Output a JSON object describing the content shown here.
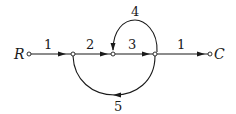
{
  "diagram": {
    "type": "signal-flow-graph",
    "input_label": "R",
    "output_label": "C",
    "colors": {
      "stroke": "#1a1a1a",
      "node_fill": "#ffffff",
      "background": "#ffffff"
    },
    "nodes": [
      {
        "id": "R",
        "x": 29,
        "y": 54
      },
      {
        "id": "n1",
        "x": 73,
        "y": 54
      },
      {
        "id": "n2",
        "x": 113,
        "y": 54
      },
      {
        "id": "n3",
        "x": 155,
        "y": 54
      },
      {
        "id": "C",
        "x": 210,
        "y": 54
      }
    ],
    "branches": [
      {
        "from": "R",
        "to": "n1",
        "gain": "1"
      },
      {
        "from": "n1",
        "to": "n2",
        "gain": "2"
      },
      {
        "from": "n2",
        "to": "n3",
        "gain": "3"
      },
      {
        "from": "n3",
        "to": "C",
        "gain": "1"
      },
      {
        "from": "n3",
        "to": "n2",
        "gain": "4",
        "path": "upper-arc"
      },
      {
        "from": "n3",
        "to": "n1",
        "gain": "5",
        "path": "lower-arc"
      }
    ]
  }
}
